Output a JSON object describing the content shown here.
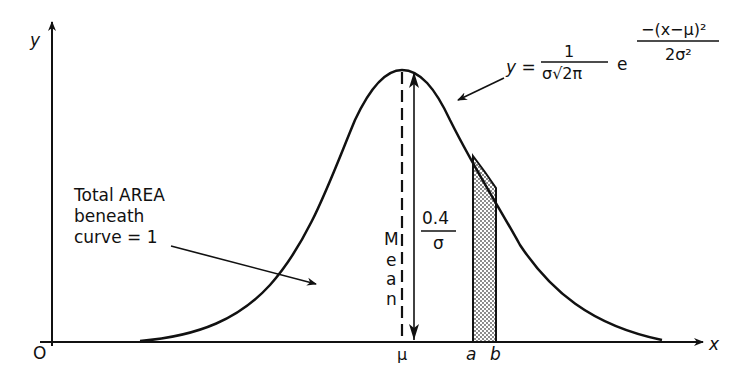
{
  "diagram": {
    "axes": {
      "x_label": "x",
      "y_label": "y",
      "origin_label": "O"
    },
    "ticks": {
      "mu": "μ",
      "a": "a",
      "b": "b"
    },
    "mean_label": [
      "M",
      "e",
      "a",
      "n"
    ],
    "height_label": {
      "numerator": "0.4",
      "denominator": "σ"
    },
    "area_note": {
      "line1": "Total AREA",
      "line2": "beneath",
      "line3": "curve = 1"
    },
    "formula": {
      "lhs": "y =",
      "coef_numerator": "1",
      "coef_denominator": "σ√2π",
      "base": "e",
      "exp_numerator": "−(x−μ)²",
      "exp_denominator": "2σ²"
    },
    "colors": {
      "ink": "#111111",
      "background": "#ffffff",
      "shade": "#9a9a9a"
    }
  }
}
